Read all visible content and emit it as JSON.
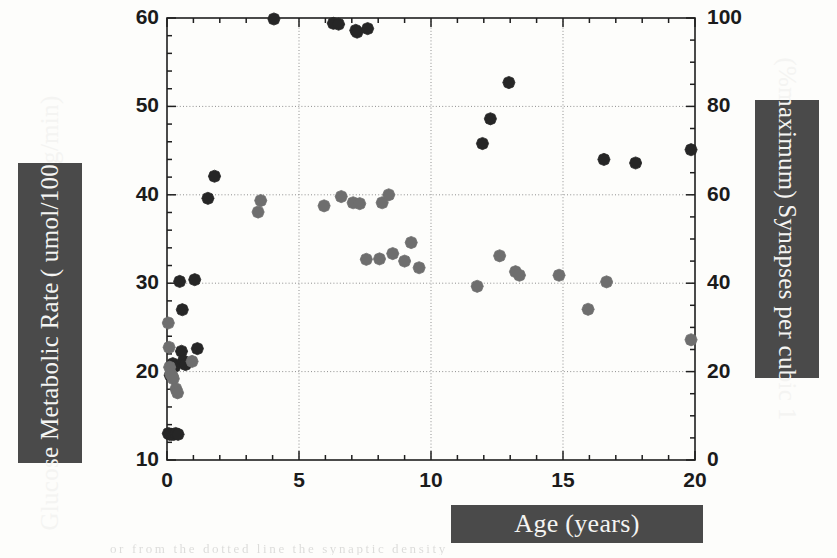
{
  "figure": {
    "background_color": "#fdfdfb",
    "label_block_color": "#4a4a4a",
    "label_text_color": "#f4f4f2",
    "scan_residue_text": "or from the dotted line the synaptic density"
  },
  "axis_labels": {
    "left": {
      "line1": "Glucose Metabolic Rate",
      "line2": "( umol/100g/min)"
    },
    "right": {
      "line1": "Synapses per cubic 1",
      "line2": "(%maximum)"
    },
    "bottom": {
      "line1": "Age (years)"
    }
  },
  "chart_data": {
    "type": "scatter",
    "title": "",
    "xlabel": "Age (years)",
    "ylabel": "Glucose Metabolic Rate ( umol/100g/min)",
    "y2label": "Synapses per cubic 1 (%maximum)",
    "xlim": [
      0,
      20
    ],
    "ylim": [
      10,
      60
    ],
    "y2lim": [
      0,
      100
    ],
    "xticks": [
      0,
      5,
      10,
      15,
      20
    ],
    "yticks": [
      10,
      20,
      30,
      40,
      50,
      60
    ],
    "y2ticks": [
      0,
      20,
      40,
      60,
      80,
      100
    ],
    "x_minor_tick_step": 1,
    "y_minor_tick_step": 2,
    "y2_minor_tick_step": 5,
    "grid": "dotted gridlines at x = 5, 10, 15 and y = 20, 30, 40, 50",
    "gridlines_x": [
      5,
      10,
      15
    ],
    "gridlines_y": [
      20,
      30,
      40,
      50
    ],
    "legend_position": "none",
    "marker_shape": "diamond",
    "series": [
      {
        "name": "Glucose metabolic rate",
        "color": "#262626",
        "axis": "left",
        "points": [
          [
            0.05,
            13.0
          ],
          [
            0.1,
            12.9
          ],
          [
            0.18,
            12.9
          ],
          [
            0.26,
            12.9
          ],
          [
            0.33,
            13.0
          ],
          [
            0.42,
            12.9
          ],
          [
            0.12,
            19.6
          ],
          [
            0.22,
            20.9
          ],
          [
            0.3,
            20.6
          ],
          [
            0.55,
            22.3
          ],
          [
            0.62,
            21.2
          ],
          [
            0.7,
            20.8
          ],
          [
            0.58,
            27.0
          ],
          [
            0.48,
            30.2
          ],
          [
            1.05,
            30.4
          ],
          [
            1.15,
            22.6
          ],
          [
            1.55,
            39.6
          ],
          [
            1.8,
            42.1
          ],
          [
            6.3,
            59.4
          ],
          [
            6.5,
            59.3
          ],
          [
            7.15,
            58.6
          ],
          [
            7.2,
            58.4
          ],
          [
            7.6,
            58.8
          ],
          [
            4.05,
            60.0
          ],
          [
            12.95,
            52.7
          ],
          [
            12.25,
            48.6
          ],
          [
            11.95,
            45.8
          ],
          [
            16.55,
            44.0
          ],
          [
            17.75,
            43.6
          ],
          [
            19.85,
            45.1
          ]
        ]
      },
      {
        "name": "Synaptic density (% maximum)",
        "color": "#6e6e6e",
        "axis": "right",
        "points": [
          [
            0.05,
            31.0
          ],
          [
            0.08,
            25.5
          ],
          [
            0.1,
            21.0
          ],
          [
            0.14,
            19.5
          ],
          [
            0.2,
            19.0
          ],
          [
            0.24,
            18.4
          ],
          [
            0.34,
            16.1
          ],
          [
            0.4,
            15.2
          ],
          [
            0.95,
            22.3
          ],
          [
            3.45,
            56.1
          ],
          [
            3.55,
            58.7
          ],
          [
            5.95,
            57.5
          ],
          [
            6.6,
            59.6
          ],
          [
            7.05,
            58.2
          ],
          [
            7.3,
            58.0
          ],
          [
            8.15,
            58.2
          ],
          [
            8.4,
            60.0
          ],
          [
            8.05,
            45.5
          ],
          [
            8.55,
            46.7
          ],
          [
            9.25,
            49.2
          ],
          [
            9.0,
            45.0
          ],
          [
            9.55,
            43.5
          ],
          [
            7.55,
            45.4
          ],
          [
            11.75,
            39.3
          ],
          [
            12.6,
            46.2
          ],
          [
            13.2,
            42.6
          ],
          [
            13.35,
            41.8
          ],
          [
            14.85,
            41.8
          ],
          [
            15.95,
            34.1
          ],
          [
            16.65,
            40.3
          ],
          [
            19.85,
            27.2
          ]
        ]
      }
    ]
  },
  "plot_geometry": {
    "left_px": 167,
    "top_px": 18,
    "right_px": 695,
    "bottom_px": 460
  }
}
